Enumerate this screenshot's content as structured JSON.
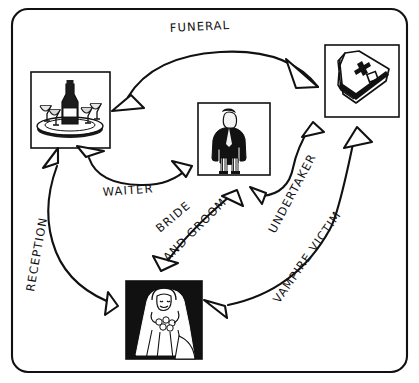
{
  "page": {
    "cropped_top_text": "· ·· · ··  · · ·· ·  ·· · ··· ··",
    "background": "#ffffff",
    "ink": "#111111",
    "frame": "rounded-rectangle-border"
  },
  "diagram": {
    "type": "cycle-diagram",
    "title_visible": false,
    "nodes": [
      {
        "id": "tray",
        "name": "drinks-tray-photo",
        "caption": "tray of wine bottle and glasses",
        "x": 31,
        "y": 72,
        "w": 79,
        "h": 76
      },
      {
        "id": "undertaker",
        "name": "undertaker-photo",
        "caption": "man in dark coat and striped trousers",
        "x": 198,
        "y": 103,
        "w": 72,
        "h": 72
      },
      {
        "id": "coffin",
        "name": "coffin-photo",
        "caption": "coffin with cross",
        "x": 325,
        "y": 45,
        "w": 74,
        "h": 72
      },
      {
        "id": "bride",
        "name": "bride-photo",
        "caption": "bride with bouquet",
        "x": 126,
        "y": 281,
        "w": 76,
        "h": 78
      }
    ],
    "edges": [
      {
        "id": "funeral",
        "label": "FUNERAL",
        "from": "tray",
        "to": "coffin",
        "arrows": "both"
      },
      {
        "id": "waiter",
        "label": "WAITER",
        "from": "tray",
        "to": "undertaker",
        "arrows": "both"
      },
      {
        "id": "bride-groom",
        "label": "BRIDE AND GROOM",
        "from": "bride",
        "to": "undertaker",
        "arrows": "both"
      },
      {
        "id": "undertaker",
        "label": "UNDERTAKER",
        "from": "undertaker",
        "to": "coffin",
        "arrows": "forward"
      },
      {
        "id": "vampire-victim",
        "label": "VAMPIRE VICTIM",
        "from": "bride",
        "to": "coffin",
        "arrows": "both"
      },
      {
        "id": "reception",
        "label": "RECEPTION",
        "from": "bride",
        "to": "tray",
        "arrows": "both"
      }
    ],
    "labels": {
      "funeral": "FUNERAL",
      "waiter": "WAITER",
      "bride": "BRIDE",
      "and_groom": "AND GROOM",
      "undertaker": "UNDERTAKER",
      "vampire_victim": "VAMPIRE VICTIM",
      "reception": "RECEPTION"
    }
  }
}
